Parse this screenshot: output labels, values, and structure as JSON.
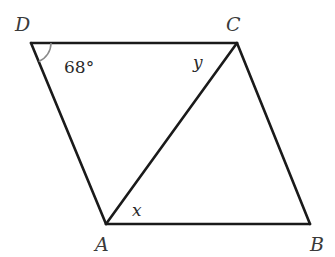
{
  "diagram": {
    "type": "parallelogram",
    "vertices": {
      "A": {
        "label": "A"
      },
      "B": {
        "label": "B"
      },
      "C": {
        "label": "C"
      },
      "D": {
        "label": "D"
      }
    },
    "sides": [
      "DC",
      "CB",
      "BA",
      "AD"
    ],
    "diagonals": [
      "AC"
    ],
    "angle_labels": {
      "D": "68°",
      "ACD": "y",
      "CAB": "x"
    }
  }
}
